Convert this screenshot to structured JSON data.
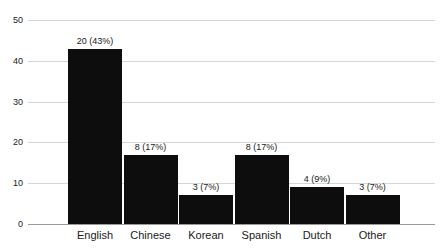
{
  "chart_data": {
    "type": "bar",
    "title": "",
    "subtitle": "",
    "xlabel": "",
    "ylabel": "",
    "categories": [
      "English",
      "Chinese",
      "Korean",
      "Spanish",
      "Dutch",
      "Other"
    ],
    "values": [
      43,
      17,
      7,
      17,
      9,
      7
    ],
    "counts": [
      20,
      8,
      3,
      8,
      4,
      3
    ],
    "percents": [
      43,
      17,
      7,
      17,
      9,
      7
    ],
    "data_labels": [
      "20 (43%)",
      "8 (17%)",
      "3 (7%)",
      "8 (17%)",
      "4 (9%)",
      "3 (7%)"
    ],
    "ylim": [
      0,
      50
    ],
    "yticks": [
      0,
      10,
      20,
      30,
      40,
      50
    ],
    "ytick_labels": [
      "0",
      "10",
      "20",
      "30",
      "40",
      "50"
    ],
    "grid": true,
    "legend": false,
    "legend_position": "none",
    "bar_color": "#0d0d0d",
    "gridline_color": "#d7d7d7",
    "axis_color": "#9a9a9a",
    "text_color": "#1a1a1a",
    "background_color": "#ffffff"
  }
}
